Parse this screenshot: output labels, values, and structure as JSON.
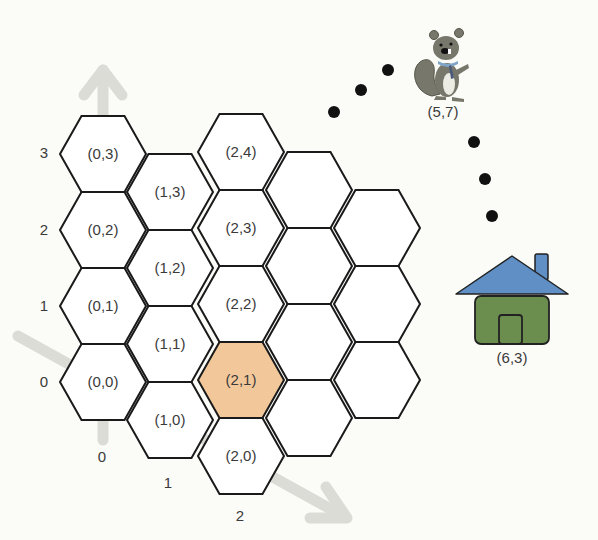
{
  "diagram": {
    "colors": {
      "background": "#fbfbf8",
      "hex_fill": "#ffffff",
      "hex_stroke": "#1a1a1a",
      "highlight_fill": "#f2c89a",
      "axis_arrow": "#dcdcd6",
      "dots": "#111111",
      "roof": "#5f8fc4",
      "house_body": "#6b8e4e",
      "squirrel_body": "#77776b",
      "squirrel_belly": "#ecece4",
      "scarf": "#7fa6c8"
    },
    "axes": {
      "vertical_labels": [
        "0",
        "1",
        "2",
        "3"
      ],
      "diagonal_labels": [
        "0",
        "1",
        "2"
      ]
    },
    "grid": {
      "columns": [
        {
          "col": 0,
          "rows": [
            0,
            1,
            2,
            3
          ]
        },
        {
          "col": 1,
          "rows": [
            0,
            1,
            2,
            3
          ]
        },
        {
          "col": 2,
          "rows": [
            0,
            1,
            2,
            3,
            4
          ]
        },
        {
          "col": 3,
          "rows": [
            0,
            1,
            2,
            3
          ]
        },
        {
          "col": 4,
          "rows": [
            0,
            1,
            2
          ]
        }
      ],
      "labeled_cells": [
        {
          "col": 0,
          "row": 0,
          "label": "(0,0)"
        },
        {
          "col": 0,
          "row": 1,
          "label": "(0,1)"
        },
        {
          "col": 0,
          "row": 2,
          "label": "(0,2)"
        },
        {
          "col": 0,
          "row": 3,
          "label": "(0,3)"
        },
        {
          "col": 1,
          "row": 0,
          "label": "(1,0)"
        },
        {
          "col": 1,
          "row": 1,
          "label": "(1,1)"
        },
        {
          "col": 1,
          "row": 2,
          "label": "(1,2)"
        },
        {
          "col": 1,
          "row": 3,
          "label": "(1,3)"
        },
        {
          "col": 2,
          "row": 0,
          "label": "(2,0)"
        },
        {
          "col": 2,
          "row": 1,
          "label": "(2,1)"
        },
        {
          "col": 2,
          "row": 2,
          "label": "(2,2)"
        },
        {
          "col": 2,
          "row": 3,
          "label": "(2,3)"
        },
        {
          "col": 2,
          "row": 4,
          "label": "(2,4)"
        }
      ],
      "highlighted_cell": {
        "col": 2,
        "row": 1,
        "label": "(2,1)"
      }
    },
    "squirrel": {
      "label": "(5,7)",
      "icon": "squirrel-icon"
    },
    "house": {
      "label": "(6,3)",
      "icon": "house-icon"
    },
    "path_dots": {
      "left_arc_count": 3,
      "right_arc_count": 3
    }
  }
}
